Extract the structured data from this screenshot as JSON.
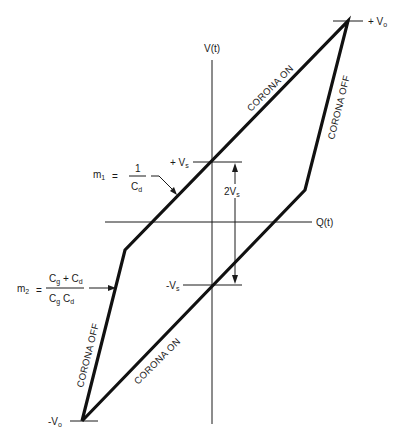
{
  "diagram": {
    "type": "hysteresis loop (Q-V plot)",
    "axes": {
      "y_label": "V(t)",
      "x_label": "Q(t)"
    },
    "levels": {
      "plus_vo": "+ V",
      "plus_vo_sub": "o",
      "minus_vo": "-V",
      "minus_vo_sub": "o",
      "plus_vs": "+ V",
      "plus_vs_sub": "s",
      "minus_vs": "-V",
      "minus_vs_sub": "s",
      "amplitude": "2V",
      "amplitude_sub": "s"
    },
    "segments": {
      "upper_on": "CORONA ON",
      "right_off": "CORONA OFF",
      "lower_on": "CORONA ON",
      "left_off": "CORONA OFF"
    },
    "slopes": {
      "m1": {
        "name": "m",
        "sub": "1",
        "eq": "=",
        "num": "1",
        "den": "C",
        "den_sub": "d"
      },
      "m2": {
        "name": "m",
        "sub": "2",
        "eq": "=",
        "num_a": "C",
        "num_a_sub": "g",
        "num_plus": " + C",
        "num_b_sub": "d",
        "den_a": "C",
        "den_a_sub": "g",
        "den_b": " C",
        "den_b_sub": "d"
      }
    },
    "colors": {
      "ink": "#1a1a1a",
      "background": "#ffffff"
    }
  }
}
